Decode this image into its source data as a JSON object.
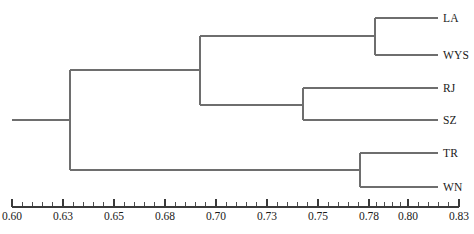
{
  "figure": {
    "type": "dendrogram",
    "caption": ""
  },
  "chart_data": {
    "type": "dendrogram",
    "title": "",
    "xlabel": "",
    "ylabel": "",
    "xlim": [
      0.6,
      0.83
    ],
    "grid": false,
    "legend_position": "none",
    "orientation": "horizontal-right",
    "similarity_axis_ticks": [
      "0.60",
      "0.63",
      "0.65",
      "0.68",
      "0.70",
      "0.73",
      "0.75",
      "0.78",
      "0.80",
      "0.83"
    ],
    "tick_values": [
      0.6,
      0.63,
      0.65,
      0.68,
      0.7,
      0.73,
      0.75,
      0.78,
      0.8,
      0.83
    ],
    "minor_ticks_between_majors": 4,
    "leaves": [
      {
        "label": "LA",
        "order": 1
      },
      {
        "label": "WYS",
        "order": 2
      },
      {
        "label": "RJ",
        "order": 3
      },
      {
        "label": "SZ",
        "order": 4
      },
      {
        "label": "TR",
        "order": 5
      },
      {
        "label": "WN",
        "order": 6
      }
    ],
    "merges": [
      {
        "id": "n1",
        "children": [
          "LA",
          "WYS"
        ],
        "distance": 0.8
      },
      {
        "id": "n2",
        "children": [
          "RJ",
          "SZ"
        ],
        "distance": 0.758
      },
      {
        "id": "n3",
        "children": [
          "TR",
          "WN"
        ],
        "distance": 0.791
      },
      {
        "id": "n4",
        "children": [
          "n1",
          "n2"
        ],
        "distance": 0.698
      },
      {
        "id": "n5",
        "children": [
          "n4",
          "n3"
        ],
        "distance": 0.632
      }
    ],
    "colors": {
      "branch": "#6e6e6e",
      "axis": "#3a3a3a",
      "text": "#1a1a1a",
      "background": "#ffffff"
    }
  },
  "axis": {
    "labels": [
      {
        "text": "0.60",
        "x": 12
      },
      {
        "text": "0.63",
        "x": 63
      },
      {
        "text": "0.65",
        "x": 114
      },
      {
        "text": "0.68",
        "x": 165
      },
      {
        "text": "0.70",
        "x": 216
      },
      {
        "text": "0.73",
        "x": 267
      },
      {
        "text": "0.75",
        "x": 318
      },
      {
        "text": "0.78",
        "x": 369
      },
      {
        "text": "0.80",
        "x": 408
      },
      {
        "text": "0.83",
        "x": 459
      }
    ]
  },
  "leaf_labels": [
    {
      "text": "LA",
      "x": 443,
      "y": 12
    },
    {
      "text": "WYS",
      "x": 443,
      "y": 49
    },
    {
      "text": "RJ",
      "x": 443,
      "y": 82
    },
    {
      "text": "SZ",
      "x": 443,
      "y": 114
    },
    {
      "text": "TR",
      "x": 443,
      "y": 147
    },
    {
      "text": "WN",
      "x": 443,
      "y": 181
    }
  ]
}
